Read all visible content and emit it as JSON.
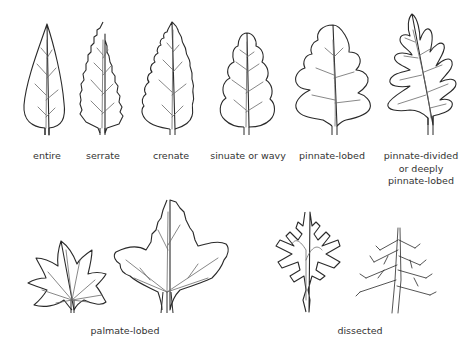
{
  "labels": {
    "entire": "entire",
    "serrate": "serrate",
    "crenate": "crenate",
    "sinuate": "sinuate or wavy",
    "pinnate_lobed": "pinnate-lobed",
    "pinnate_divided_1": "pinnate-divided",
    "pinnate_divided_2": "or deeply",
    "pinnate_divided_3": "pinnate-lobed",
    "palmate_lobed": "palmate-lobed",
    "dissected": "dissected"
  },
  "colors": {
    "outline": "#2a2a2a",
    "vein": "#6a6a6a",
    "label": "#333333",
    "background": "#ffffff"
  }
}
